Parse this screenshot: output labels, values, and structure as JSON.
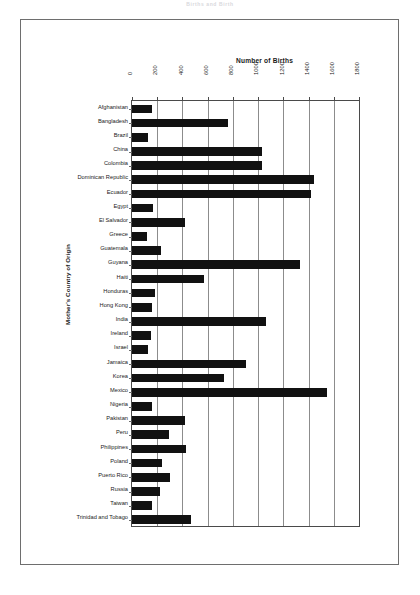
{
  "scan": {
    "header_text": "Births and Birth"
  },
  "chart_data": {
    "type": "bar",
    "orientation": "horizontal",
    "title": "Number of Births",
    "xlabel": "Number of Births",
    "ylabel": "Mother's Country of Origin",
    "xlim": [
      0,
      1800
    ],
    "xticks": [
      0,
      200,
      400,
      600,
      800,
      1000,
      1200,
      1400,
      1600,
      1800
    ],
    "xtick_labels": [
      "0",
      "200",
      "400",
      "600",
      "800",
      "1000",
      "1200",
      "1400",
      "1600",
      "1800"
    ],
    "grid": true,
    "legend": "none",
    "bar_color": "#111111",
    "categories": [
      "Afghanistan",
      "Bangladesh",
      "Brazil",
      "China",
      "Colombia",
      "Dominican Republic",
      "Ecuador",
      "Egypt",
      "El Salvador",
      "Greece",
      "Guatemala",
      "Guyana",
      "Haiti",
      "Honduras",
      "Hong Kong",
      "India",
      "Ireland",
      "Israel",
      "Jamaica",
      "Korea",
      "Mexico",
      "Nigeria",
      "Pakistan",
      "Peru",
      "Philippines",
      "Poland",
      "Puerto Rico",
      "Russia",
      "Taiwan",
      "Trinidad and Tobago"
    ],
    "values": [
      160,
      760,
      130,
      1030,
      1030,
      1440,
      1420,
      170,
      420,
      120,
      230,
      1330,
      570,
      180,
      160,
      1060,
      150,
      130,
      900,
      730,
      1550,
      160,
      420,
      290,
      430,
      240,
      300,
      220,
      160,
      470
    ]
  }
}
